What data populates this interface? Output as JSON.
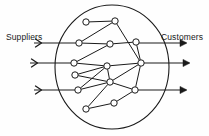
{
  "figure": {
    "title": "",
    "type": "supply-network-diagram",
    "background_color": "#fefefe",
    "line_color": "#1a1a1a",
    "node_fill_color": "#ffffff",
    "labels": {
      "suppliers": "Suppliers",
      "customers": "Customers"
    }
  },
  "boundary": {
    "name": "network-boundary-ellipse",
    "cx": 112,
    "cy": 67,
    "rx": 57,
    "ry": 62
  },
  "input_flows": [
    {
      "name": "supplier-flow-1",
      "y": 43,
      "x_start": 34,
      "x_end": 79,
      "arrow": "chevron",
      "arrow_x": 40
    },
    {
      "name": "supplier-flow-2",
      "y": 63,
      "x_start": 30,
      "x_end": 74,
      "arrow": "chevron",
      "arrow_x": 36
    },
    {
      "name": "supplier-flow-3",
      "y": 90,
      "x_start": 34,
      "x_end": 78,
      "arrow": "chevron",
      "arrow_x": 40
    }
  ],
  "output_flows": [
    {
      "name": "customer-flow-1",
      "y": 43,
      "x_start": 136,
      "x_end": 186,
      "arrow": "triangle",
      "arrow_x": 180
    },
    {
      "name": "customer-flow-2",
      "y": 63,
      "x_start": 141,
      "x_end": 189,
      "arrow": "triangle",
      "arrow_x": 183
    },
    {
      "name": "customer-flow-3",
      "y": 90,
      "x_start": 135,
      "x_end": 186,
      "arrow": "triangle",
      "arrow_x": 180
    }
  ],
  "nodes": [
    {
      "id": "n1",
      "name": "node-top-left",
      "x": 86,
      "y": 22
    },
    {
      "id": "n2",
      "name": "node-top-mid",
      "x": 115,
      "y": 21
    },
    {
      "id": "n3",
      "name": "node-left-1",
      "x": 79,
      "y": 43
    },
    {
      "id": "n4",
      "name": "node-mid-upper",
      "x": 110,
      "y": 44
    },
    {
      "id": "n5",
      "name": "node-right-upper",
      "x": 136,
      "y": 42
    },
    {
      "id": "n6",
      "name": "node-left-2",
      "x": 74,
      "y": 63
    },
    {
      "id": "n7",
      "name": "node-center-hub",
      "x": 107,
      "y": 66
    },
    {
      "id": "n8",
      "name": "node-right-hub",
      "x": 141,
      "y": 63
    },
    {
      "id": "n9",
      "name": "node-left-3",
      "x": 75,
      "y": 75
    },
    {
      "id": "n10",
      "name": "node-mid-lower",
      "x": 110,
      "y": 82
    },
    {
      "id": "n11",
      "name": "node-left-4",
      "x": 78,
      "y": 90
    },
    {
      "id": "n12",
      "name": "node-right-lower",
      "x": 135,
      "y": 90
    },
    {
      "id": "n13",
      "name": "node-bottom-left",
      "x": 86,
      "y": 109
    },
    {
      "id": "n14",
      "name": "node-bottom-mid",
      "x": 114,
      "y": 103
    }
  ],
  "edges": [
    {
      "from": "n1",
      "to": "n2"
    },
    {
      "from": "n3",
      "to": "n2"
    },
    {
      "from": "n3",
      "to": "n4"
    },
    {
      "from": "n2",
      "to": "n8"
    },
    {
      "from": "n4",
      "to": "n5"
    },
    {
      "from": "n4",
      "to": "n6"
    },
    {
      "from": "n5",
      "to": "n8"
    },
    {
      "from": "n6",
      "to": "n7"
    },
    {
      "from": "n7",
      "to": "n8"
    },
    {
      "from": "n9",
      "to": "n7"
    },
    {
      "from": "n7",
      "to": "n10"
    },
    {
      "from": "n9",
      "to": "n10"
    },
    {
      "from": "n11",
      "to": "n7"
    },
    {
      "from": "n11",
      "to": "n10"
    },
    {
      "from": "n10",
      "to": "n8"
    },
    {
      "from": "n10",
      "to": "n12"
    },
    {
      "from": "n13",
      "to": "n10"
    },
    {
      "from": "n13",
      "to": "n14"
    },
    {
      "from": "n14",
      "to": "n12"
    },
    {
      "from": "n12",
      "to": "n8"
    }
  ],
  "node_radius": 3.2
}
